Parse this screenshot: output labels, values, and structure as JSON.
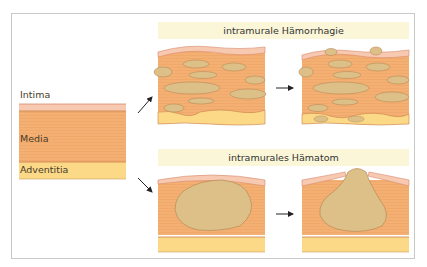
{
  "diagram": {
    "layers": {
      "intima": "Intima",
      "media": "Media",
      "adventitia": "Adventitia"
    },
    "panels": {
      "top_title": "intramurale Hämorrhagie",
      "bottom_title": "intramurales Hämatom"
    },
    "colors": {
      "intima": "#f6c9b0",
      "media": "#f4b072",
      "adventitia": "#fbd987",
      "blood": "#dcc088",
      "title_bg": "#fbf6d8",
      "border_line": "#c97f4a"
    }
  }
}
